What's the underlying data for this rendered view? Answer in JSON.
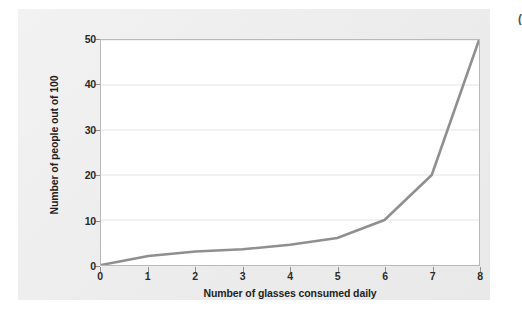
{
  "figure": {
    "background_color": "#efefef",
    "plot_background_color": "#ffffff",
    "edge_mark_text": "("
  },
  "chart_data": {
    "type": "line",
    "title": "",
    "subtitle": "",
    "xlabel": "Number of glasses consumed daily",
    "ylabel": "Number of people out of 100",
    "x": [
      0,
      1,
      2,
      3,
      4,
      5,
      6,
      7,
      8
    ],
    "values": [
      0,
      2,
      3,
      3.5,
      4.5,
      6,
      10,
      20,
      50
    ],
    "series": [
      {
        "name": "People out of 100",
        "color": "#8f8f8f",
        "values": [
          0,
          2,
          3,
          3.5,
          4.5,
          6,
          10,
          20,
          50
        ]
      }
    ],
    "xlim": [
      0,
      8
    ],
    "ylim": [
      0,
      50
    ],
    "x_ticks": [
      "0",
      "1",
      "2",
      "3",
      "4",
      "5",
      "6",
      "7",
      "8"
    ],
    "y_ticks": [
      "0",
      "10",
      "20",
      "30",
      "40",
      "50"
    ],
    "x_tick_values": [
      0,
      1,
      2,
      3,
      4,
      5,
      6,
      7,
      8
    ],
    "y_tick_values": [
      0,
      10,
      20,
      30,
      40,
      50
    ],
    "grid": "horizontal",
    "grid_color": "#e3e3e3",
    "legend": "none",
    "line_color": "#8f8f8f",
    "line_width": 2.6
  }
}
